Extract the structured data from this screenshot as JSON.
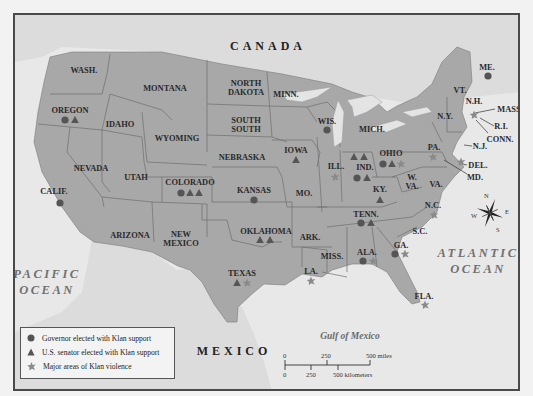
{
  "map": {
    "regions": {
      "country_north": "CANADA",
      "country_south": "MEXICO",
      "ocean_west": [
        "PACIFIC",
        "OCEAN"
      ],
      "ocean_east": [
        "ATLANTIC",
        "OCEAN"
      ],
      "gulf": "Gulf of Mexico"
    },
    "states": [
      {
        "label": "WASH.",
        "markers": []
      },
      {
        "label": "OREGON",
        "markers": [
          "governor",
          "senator"
        ]
      },
      {
        "label": "CALIF.",
        "markers": [
          "governor"
        ]
      },
      {
        "label": "IDAHO",
        "markers": []
      },
      {
        "label": "NEVADA",
        "markers": []
      },
      {
        "label": "MONTANA",
        "markers": []
      },
      {
        "label": "WYOMING",
        "markers": []
      },
      {
        "label": "UTAH",
        "markers": []
      },
      {
        "label": "ARIZONA",
        "markers": []
      },
      {
        "label": "COLORADO",
        "markers": [
          "governor",
          "senator",
          "senator"
        ]
      },
      {
        "label": "NEW MEXICO",
        "markers": []
      },
      {
        "label": "NORTH DAKOTA",
        "markers": []
      },
      {
        "label": "SOUTH DAKOTA",
        "markers": []
      },
      {
        "label": "NEBRASKA",
        "markers": []
      },
      {
        "label": "KANSAS",
        "markers": [
          "governor"
        ]
      },
      {
        "label": "OKLAHOMA",
        "markers": [
          "senator",
          "senator"
        ]
      },
      {
        "label": "TEXAS",
        "markers": [
          "senator",
          "violence"
        ]
      },
      {
        "label": "MINN.",
        "markers": []
      },
      {
        "label": "IOWA",
        "markers": [
          "senator"
        ]
      },
      {
        "label": "MO.",
        "markers": []
      },
      {
        "label": "ARK.",
        "markers": []
      },
      {
        "label": "LA.",
        "markers": [
          "violence"
        ]
      },
      {
        "label": "WIS.",
        "markers": [
          "governor"
        ]
      },
      {
        "label": "ILL.",
        "markers": [
          "violence"
        ]
      },
      {
        "label": "MICH.",
        "markers": []
      },
      {
        "label": "IND.",
        "markers": [
          "senator",
          "senator",
          "governor",
          "senator"
        ]
      },
      {
        "label": "OHIO",
        "markers": [
          "governor",
          "senator",
          "violence"
        ]
      },
      {
        "label": "KY.",
        "markers": [
          "senator"
        ]
      },
      {
        "label": "TENN.",
        "markers": [
          "governor",
          "senator"
        ]
      },
      {
        "label": "MISS.",
        "markers": []
      },
      {
        "label": "ALA.",
        "markers": [
          "governor",
          "violence"
        ]
      },
      {
        "label": "GA.",
        "markers": [
          "governor",
          "violence"
        ]
      },
      {
        "label": "FLA.",
        "markers": [
          "violence"
        ]
      },
      {
        "label": "S.C.",
        "markers": []
      },
      {
        "label": "N.C.",
        "markers": [
          "violence"
        ]
      },
      {
        "label": "VA.",
        "markers": []
      },
      {
        "label": "W. VA.",
        "markers": []
      },
      {
        "label": "MD.",
        "markers": []
      },
      {
        "label": "DEL.",
        "markers": []
      },
      {
        "label": "PA.",
        "markers": [
          "violence"
        ]
      },
      {
        "label": "N.J.",
        "markers": [
          "violence"
        ]
      },
      {
        "label": "N.Y.",
        "markers": []
      },
      {
        "label": "CONN.",
        "markers": []
      },
      {
        "label": "R.I.",
        "markers": []
      },
      {
        "label": "MASS.",
        "markers": [
          "violence"
        ]
      },
      {
        "label": "VT.",
        "markers": []
      },
      {
        "label": "N.H.",
        "markers": []
      },
      {
        "label": "ME.",
        "markers": [
          "governor"
        ]
      }
    ],
    "compass": {
      "n": "N",
      "s": "S",
      "e": "E",
      "w": "W"
    }
  },
  "legend": {
    "items": [
      {
        "icon": "circle",
        "label": "Governor elected with Klan support"
      },
      {
        "icon": "triangle",
        "label": "U.S. senator elected with Klan support"
      },
      {
        "icon": "starburst",
        "label": "Major areas of Klan violence"
      }
    ]
  },
  "scale": {
    "miles": {
      "zero": "0",
      "mid": "250",
      "end": "500 miles"
    },
    "km": {
      "zero": "0",
      "mid": "250",
      "end": "500 kilometers"
    }
  },
  "colors": {
    "land_us": "#a9a9a9",
    "land_other": "#d4d4d4",
    "water": "#e9e9e9",
    "marker_dark": "#555555",
    "marker_violence": "#8a8a8a"
  }
}
